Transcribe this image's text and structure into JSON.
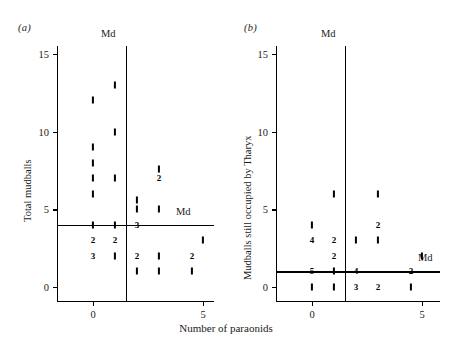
{
  "figure": {
    "width": 452,
    "height": 348,
    "background": "#ffffff",
    "ink": "#000000",
    "xlabel": "Number of paraonids"
  },
  "panels": [
    {
      "key": "a",
      "label": "(a)",
      "ylabel": "Total mudballs",
      "md_vertical_label": "Md",
      "md_horizontal_label": "Md",
      "chart_data": {
        "type": "scatter",
        "title": "(a)",
        "xlabel": "Number of paraonids",
        "ylabel": "Total mudballs",
        "xlim": [
          -0.9,
          7.2
        ],
        "ylim": [
          -1.2,
          16.4
        ],
        "xticks": [
          0,
          5
        ],
        "yticks": [
          0,
          5,
          10,
          15
        ],
        "grid": false,
        "median_x": 1.5,
        "median_y": 4,
        "note": "Each tick glyph is one observation; a bold numeral marks how many observations share that coordinate.",
        "points": [
          {
            "x": 1,
            "y": 13,
            "n": 1
          },
          {
            "x": 0,
            "y": 12,
            "n": 1
          },
          {
            "x": 1,
            "y": 10,
            "n": 1
          },
          {
            "x": 0,
            "y": 9,
            "n": 1
          },
          {
            "x": 0,
            "y": 8,
            "n": 1
          },
          {
            "x": 3,
            "y": 7.6,
            "n": 1
          },
          {
            "x": 0,
            "y": 7,
            "n": 1
          },
          {
            "x": 1,
            "y": 7,
            "n": 1
          },
          {
            "x": 3,
            "y": 7,
            "n": 2
          },
          {
            "x": 0,
            "y": 6,
            "n": 1
          },
          {
            "x": 2,
            "y": 5.6,
            "n": 1
          },
          {
            "x": 2,
            "y": 5,
            "n": 1
          },
          {
            "x": 3,
            "y": 5,
            "n": 1
          },
          {
            "x": 0,
            "y": 4,
            "n": 1
          },
          {
            "x": 1,
            "y": 4,
            "n": 1
          },
          {
            "x": 2,
            "y": 4,
            "n": 3
          },
          {
            "x": 0,
            "y": 3,
            "n": 2
          },
          {
            "x": 1,
            "y": 3,
            "n": 2
          },
          {
            "x": 5,
            "y": 3,
            "n": 1
          },
          {
            "x": 0,
            "y": 2,
            "n": 3
          },
          {
            "x": 1,
            "y": 2,
            "n": 1
          },
          {
            "x": 2,
            "y": 2,
            "n": 2
          },
          {
            "x": 3,
            "y": 2,
            "n": 1
          },
          {
            "x": 4.5,
            "y": 2,
            "n": 2
          },
          {
            "x": 2,
            "y": 1,
            "n": 1
          },
          {
            "x": 3,
            "y": 1,
            "n": 1
          },
          {
            "x": 4.5,
            "y": 1,
            "n": 1
          }
        ]
      }
    },
    {
      "key": "b",
      "label": "(b)",
      "ylabel": "Mudballs still occupied by Tharyx",
      "md_vertical_label": "Md",
      "md_horizontal_label": "Md",
      "chart_data": {
        "type": "scatter",
        "title": "(b)",
        "xlabel": "Number of paraonids",
        "ylabel": "Mudballs still occupied by Tharyx",
        "xlim": [
          -0.9,
          7.2
        ],
        "ylim": [
          -1.2,
          16.4
        ],
        "xticks": [
          0,
          5
        ],
        "yticks": [
          0,
          5,
          10,
          15
        ],
        "grid": false,
        "median_x": 1.5,
        "median_y": 1,
        "note": "Each tick glyph is one observation; a bold numeral marks how many observations share that coordinate.",
        "points": [
          {
            "x": 1,
            "y": 6,
            "n": 1
          },
          {
            "x": 3,
            "y": 6,
            "n": 1
          },
          {
            "x": 0,
            "y": 4,
            "n": 1
          },
          {
            "x": 3,
            "y": 4,
            "n": 2
          },
          {
            "x": 0,
            "y": 3,
            "n": 4
          },
          {
            "x": 1,
            "y": 3,
            "n": 2
          },
          {
            "x": 2,
            "y": 3,
            "n": 1
          },
          {
            "x": 3,
            "y": 3,
            "n": 1
          },
          {
            "x": 1,
            "y": 2,
            "n": 2
          },
          {
            "x": 5,
            "y": 2,
            "n": 1
          },
          {
            "x": 0,
            "y": 1,
            "n": 5
          },
          {
            "x": 1,
            "y": 1,
            "n": 1
          },
          {
            "x": 2,
            "y": 1,
            "n": 4
          },
          {
            "x": 4.5,
            "y": 1,
            "n": 2
          },
          {
            "x": 0,
            "y": 0,
            "n": 1
          },
          {
            "x": 1,
            "y": 0,
            "n": 1
          },
          {
            "x": 2,
            "y": 0,
            "n": 3
          },
          {
            "x": 3,
            "y": 0,
            "n": 2
          },
          {
            "x": 4.5,
            "y": 0,
            "n": 1
          }
        ]
      }
    }
  ]
}
